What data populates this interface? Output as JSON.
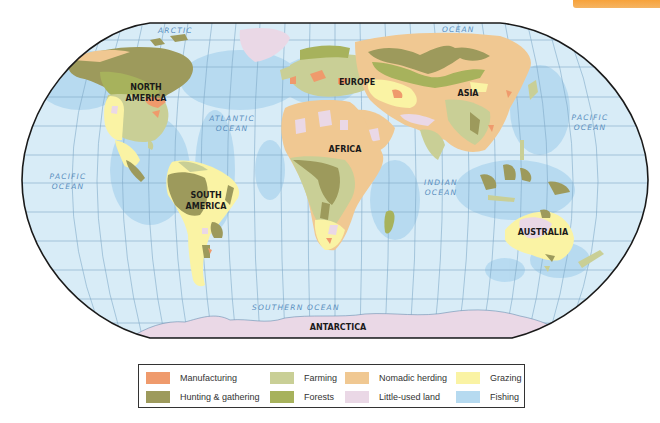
{
  "map": {
    "colors": {
      "ocean": "#d8ecf7",
      "shelf": "#b6daf0",
      "grid": "#7fa9c8",
      "outline": "#1a1a1a",
      "manufacturing": "#ef9a6c",
      "hunting_gathering": "#9d9a5c",
      "farming": "#c9cf96",
      "forests": "#a7b25c",
      "nomadic_herding": "#f0c892",
      "little_used_land": "#ead8e6",
      "grazing": "#faf3a4",
      "fishing": "#b6daf0"
    },
    "continent_labels": {
      "north_america": [
        "NORTH",
        "AMERICA"
      ],
      "south_america": [
        "SOUTH",
        "AMERICA"
      ],
      "europe": "EUROPE",
      "asia": "ASIA",
      "africa": "AFRICA",
      "australia": "AUSTRALIA",
      "antarctica": "ANTARCTICA"
    },
    "ocean_labels": {
      "arctic_1": "ARCTIC",
      "arctic_2": "OCEAN",
      "atlantic": [
        "ATLANTIC",
        "OCEAN"
      ],
      "pacific_left": [
        "PACIFIC",
        "OCEAN"
      ],
      "pacific_right": [
        "PACIFIC",
        "OCEAN"
      ],
      "indian": [
        "INDIAN",
        "OCEAN"
      ],
      "southern": "SOUTHERN OCEAN"
    }
  },
  "legend": {
    "items": [
      {
        "label": "Manufacturing",
        "color": "#ef9a6c"
      },
      {
        "label": "Farming",
        "color": "#c9cf96"
      },
      {
        "label": "Nomadic herding",
        "color": "#f0c892"
      },
      {
        "label": "Grazing",
        "color": "#faf3a4"
      },
      {
        "label": "Hunting & gathering",
        "color": "#9d9a5c"
      },
      {
        "label": "Forests",
        "color": "#a7b25c"
      },
      {
        "label": "Little-used land",
        "color": "#ead8e6"
      },
      {
        "label": "Fishing",
        "color": "#b6daf0"
      }
    ]
  }
}
